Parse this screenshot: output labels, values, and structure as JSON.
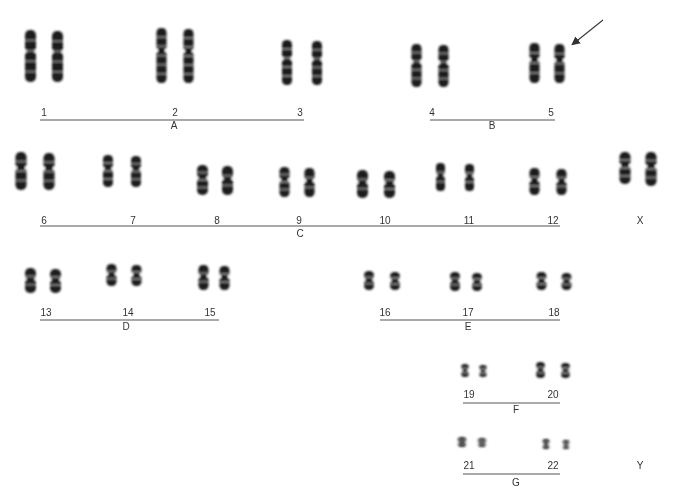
{
  "groups": [
    {
      "name": "A",
      "chromosomes": [
        "1",
        "2",
        "3"
      ]
    },
    {
      "name": "B",
      "chromosomes": [
        "4",
        "5"
      ]
    },
    {
      "name": "C",
      "chromosomes": [
        "6",
        "7",
        "8",
        "9",
        "10",
        "11",
        "12"
      ]
    },
    {
      "name": "D",
      "chromosomes": [
        "13",
        "14",
        "15"
      ]
    },
    {
      "name": "E",
      "chromosomes": [
        "16",
        "17",
        "18"
      ]
    },
    {
      "name": "F",
      "chromosomes": [
        "19",
        "20"
      ]
    },
    {
      "name": "G",
      "chromosomes": [
        "21",
        "22"
      ]
    }
  ],
  "sex_chromosomes": [
    {
      "label": "X",
      "present_count": 2
    },
    {
      "label": "Y",
      "present_count": 0
    }
  ],
  "annotation": {
    "type": "arrow",
    "points_to": "chromosome 5 (second homolog)"
  },
  "colors": {
    "background": "#ffffff",
    "chromatin": "#1a1a1a",
    "line": "#555555",
    "text": "#333333"
  }
}
